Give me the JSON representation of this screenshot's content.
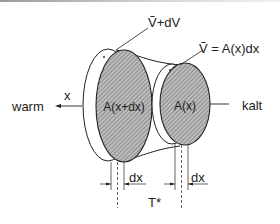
{
  "diagram": {
    "labels": {
      "volume_plus": "Ṽ+dV",
      "volume_eq": "Ṽ = A(x)dx",
      "x_axis": "x",
      "warm": "warm",
      "kalt": "kalt",
      "area_large": "A(x+dx)",
      "area_small": "A(x)",
      "dx_left": "dx",
      "dx_right": "dx",
      "temperature": "T*"
    },
    "colors": {
      "stroke": "#222222",
      "hatch_fill": "#b8b8b8",
      "hatch_line": "#5a5a5a"
    }
  }
}
